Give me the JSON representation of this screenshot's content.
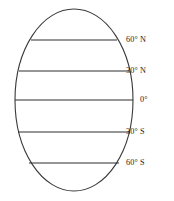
{
  "figure": {
    "name": "latitude-zones-globe",
    "background_color": "#ffffff",
    "outline_color": "#3a3a3a",
    "line_color": "#2e2e2e",
    "text_color": "#1c1c1c"
  },
  "globe": {
    "shape": "ellipse",
    "center_x": 74,
    "center_y": 100,
    "radius_x": 59,
    "radius_y": 91
  },
  "chart_data": {
    "type": "diagram",
    "title": "",
    "xlabel": "",
    "ylabel": "",
    "categories": [
      "60° N",
      "30° N",
      "0°",
      "30° S",
      "60° S"
    ],
    "values": [
      60,
      30,
      0,
      -30,
      -60
    ],
    "legend": []
  },
  "latitudes": [
    {
      "label": "60° N",
      "value": 60,
      "y": 40,
      "x_left": 31,
      "x_right": 117,
      "label_x": 126,
      "label_y": 40
    },
    {
      "label": "30° N",
      "value": 30,
      "y": 71,
      "x_left": 19,
      "x_right": 129,
      "label_x": 126,
      "label_y": 71
    },
    {
      "label": "0°",
      "value": 0,
      "y": 100,
      "x_left": 15,
      "x_right": 133,
      "label_x": 140,
      "label_y": 100
    },
    {
      "label": "30° S",
      "value": -30,
      "y": 132,
      "x_left": 18,
      "x_right": 130,
      "label_x": 126,
      "label_y": 132
    },
    {
      "label": "60° S",
      "value": -60,
      "y": 163,
      "x_left": 29,
      "x_right": 119,
      "label_x": 126,
      "label_y": 163
    }
  ]
}
